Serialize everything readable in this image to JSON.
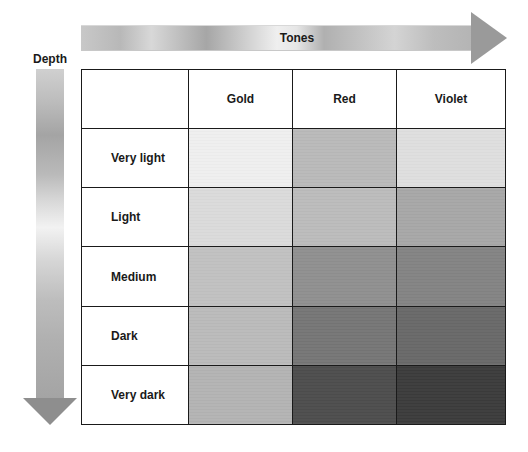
{
  "tones_arrow": {
    "label": "Tones"
  },
  "depth_arrow": {
    "label": "Depth"
  },
  "table": {
    "corner": "",
    "columns": [
      "Gold",
      "Red",
      "Violet"
    ],
    "rows": [
      {
        "label": "Very light",
        "swatches": [
          "#f3f3f3",
          "#bcbcbc",
          "#e2e2e2"
        ]
      },
      {
        "label": "Light",
        "swatches": [
          "#dedede",
          "#bebebe",
          "#a9a9a9"
        ]
      },
      {
        "label": "Medium",
        "swatches": [
          "#c4c4c4",
          "#929292",
          "#858585"
        ]
      },
      {
        "label": "Dark",
        "swatches": [
          "#bdbdbd",
          "#777777",
          "#6a6a6a"
        ]
      },
      {
        "label": "Very dark",
        "swatches": [
          "#b6b6b6",
          "#4e4e4e",
          "#3c3c3c"
        ]
      }
    ]
  }
}
